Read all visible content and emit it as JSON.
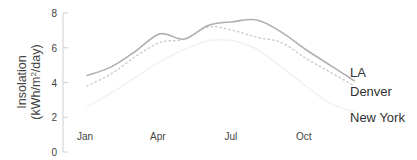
{
  "chart_data": {
    "type": "line",
    "title": "",
    "xlabel": "",
    "ylabel": "Insolation (kWh/m2/day)",
    "ylabel_lines": [
      "Insolation",
      "(kWh/m",
      "2",
      "/day)"
    ],
    "ylim": [
      0,
      8
    ],
    "yticks": [
      0,
      2,
      4,
      6,
      8
    ],
    "ytick_labels": [
      "0",
      "2",
      "4",
      "6",
      "8"
    ],
    "x": [
      "Jan",
      "Feb",
      "Mar",
      "Apr",
      "May",
      "Jun",
      "Jul",
      "Aug",
      "Sep",
      "Oct",
      "Nov",
      "Dec"
    ],
    "xtick_labels": [
      "Jan",
      "Apr",
      "Jul",
      "Oct"
    ],
    "grid": false,
    "legend_position": "direct-labels-right",
    "series": [
      {
        "name": "LA",
        "style": "solid",
        "color": "#b0b0b0",
        "values": [
          4.4,
          4.9,
          5.8,
          6.8,
          6.5,
          7.3,
          7.5,
          7.6,
          6.9,
          5.9,
          5.0,
          4.1
        ]
      },
      {
        "name": "Denver",
        "style": "dotted",
        "color": "#c8c8c8",
        "values": [
          3.8,
          4.5,
          5.5,
          6.3,
          6.5,
          7.2,
          7.0,
          6.6,
          6.3,
          5.4,
          4.6,
          3.8
        ]
      },
      {
        "name": "New York",
        "style": "solid",
        "color": "#f2f2f2",
        "values": [
          2.6,
          3.4,
          4.3,
          5.2,
          5.9,
          6.4,
          6.4,
          5.9,
          4.9,
          3.8,
          2.8,
          2.3
        ]
      }
    ]
  }
}
